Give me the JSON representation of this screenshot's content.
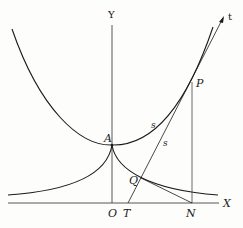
{
  "diagram": {
    "labels": {
      "y_axis": "Y",
      "x_axis": "X",
      "origin": "O",
      "vertex": "A",
      "point_p": "P",
      "point_q": "Q",
      "point_t": "T",
      "point_n": "N",
      "tangent": "t",
      "arc_length_curve": "s",
      "arc_length_tangent": "s"
    },
    "colors": {
      "stroke": "#1a1a1a",
      "axis": "#444444",
      "background": "#fdfdfb"
    }
  }
}
